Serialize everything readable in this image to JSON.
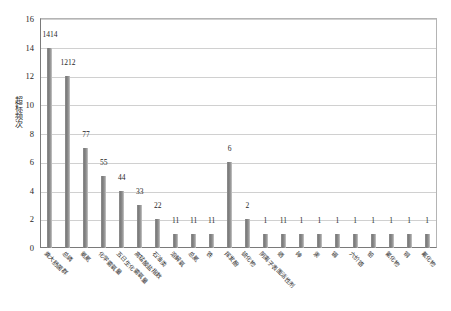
{
  "chart_data": {
    "type": "bar",
    "title": "",
    "xlabel": "",
    "ylabel": "超标频次",
    "ylim": [
      0,
      16
    ],
    "ytick_step": 2,
    "yticks": [
      0,
      2,
      4,
      6,
      8,
      10,
      12,
      14,
      16
    ],
    "grid": true,
    "legend": "none",
    "bar_color": "#7f7f7f",
    "categories": [
      "粪大肠菌群",
      "总磷",
      "氨氮",
      "化学需氧量",
      "五日生化需氧量",
      "高锰酸盐指数",
      "石油类",
      "溶解氧",
      "总氮",
      "铁",
      "挥发酚",
      "硫化物",
      "阴离子表面活性剂",
      "硒",
      "砷",
      "汞",
      "镉",
      "六价铬",
      "铅",
      "氰化物",
      "铜",
      "氟化物"
    ],
    "values": [
      14,
      12,
      7,
      5,
      4,
      3,
      2,
      1,
      1,
      1,
      6,
      2,
      1,
      1,
      1,
      1,
      1,
      1,
      1,
      1,
      1,
      1
    ],
    "data_labels": [
      "1414",
      "1212",
      "77",
      "55",
      "44",
      "33",
      "22",
      "11",
      "11",
      "11",
      "6",
      "2",
      "1",
      "11",
      "1",
      "1",
      "1",
      "1",
      "1",
      "1",
      "1",
      "1"
    ]
  }
}
